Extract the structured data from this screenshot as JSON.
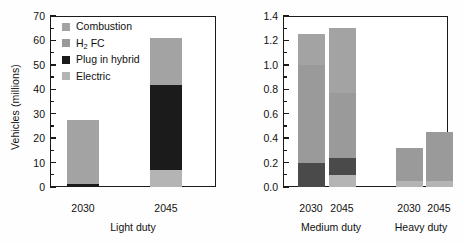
{
  "colors": {
    "combustion": "#a3a3a3",
    "h2fc": "#9a9a9a",
    "hybrid": "#1b1b1b",
    "cng_hybrid": "#4a4a4a",
    "electric": "#b4b4b4",
    "axis": "#1a1a1a",
    "background": "#ffffff"
  },
  "panels": [
    {
      "id": "light-duty",
      "ylabel": "Vehicles (millions)",
      "group_label": "Light duty",
      "yticks": [
        "0",
        "10",
        "20",
        "30",
        "40",
        "50",
        "60",
        "70"
      ],
      "legend": [
        {
          "label": "Combustion",
          "key": "combustion"
        },
        {
          "label": "H2 FC",
          "key": "h2fc",
          "sub": "2",
          "pre": "H",
          "post": " FC"
        },
        {
          "label": "Plug in hybrid",
          "key": "hybrid"
        },
        {
          "label": "Electric",
          "key": "electric"
        }
      ],
      "xticks": [
        "2030",
        "2045"
      ]
    },
    {
      "id": "medium-heavy-duty",
      "ylabel": "Vehicles (millions)",
      "group_labels": [
        "Medium duty",
        "Heavy duty"
      ],
      "yticks": [
        "0.0",
        "0.2",
        "0.4",
        "0.6",
        "0.8",
        "1.0",
        "1.2",
        "1.4"
      ],
      "legend": [
        {
          "label": "Combustion",
          "key": "combustion"
        },
        {
          "label": "H2 FC",
          "key": "h2fc",
          "sub": "2",
          "pre": "H",
          "post": " FC"
        },
        {
          "label": "CNG hybrid",
          "key": "cng_hybrid"
        },
        {
          "label": "Electric",
          "key": "electric"
        }
      ],
      "xticks": [
        "2030",
        "2045",
        "2030",
        "2045"
      ]
    }
  ],
  "chart_data": [
    {
      "type": "bar",
      "stacked": true,
      "title": "",
      "xlabel": "Light duty",
      "ylabel": "Vehicles (millions)",
      "ylim": [
        0,
        70
      ],
      "ytick_step": 10,
      "grid": false,
      "legend_position": "top-left-inside",
      "categories": [
        "2030",
        "2045"
      ],
      "series": [
        {
          "name": "Electric",
          "values": [
            0.0,
            6.8
          ]
        },
        {
          "name": "Plug in hybrid",
          "values": [
            1.3,
            35.0
          ]
        },
        {
          "name": "H2 FC",
          "values": [
            0.0,
            0.0
          ]
        },
        {
          "name": "Combustion",
          "values": [
            26.2,
            19.0
          ]
        }
      ],
      "totals": [
        27.5,
        60.8
      ]
    },
    {
      "type": "bar",
      "stacked": true,
      "title": "",
      "xlabel": "Medium duty / Heavy duty",
      "ylabel": "Vehicles (millions)",
      "ylim": [
        0.0,
        1.4
      ],
      "ytick_step": 0.2,
      "grid": false,
      "legend_position": "top-right-inside",
      "groups": [
        "Medium duty",
        "Heavy duty"
      ],
      "categories": [
        "2030",
        "2045",
        "2030",
        "2045"
      ],
      "series": [
        {
          "name": "Electric",
          "values": [
            0.0,
            0.1,
            0.05,
            0.05
          ]
        },
        {
          "name": "CNG hybrid",
          "values": [
            0.2,
            0.14,
            0.0,
            0.0
          ]
        },
        {
          "name": "H2 FC",
          "values": [
            0.8,
            0.53,
            0.27,
            0.4
          ]
        },
        {
          "name": "Combustion",
          "values": [
            0.25,
            0.53,
            0.0,
            0.0
          ]
        }
      ],
      "totals": [
        1.25,
        1.3,
        0.32,
        0.45
      ]
    }
  ]
}
